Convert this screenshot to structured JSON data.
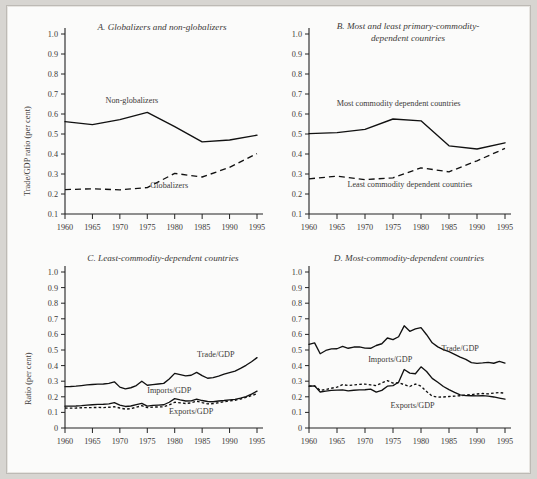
{
  "figure": {
    "background_color": "#fbfbfa",
    "page_color": "#d7d5d1",
    "line_color": "#111111",
    "text_color": "#3b3a38"
  },
  "chart_data": [
    {
      "id": "A",
      "type": "line",
      "title": "A.  Globalizers and non-globalizers",
      "xlabel": "",
      "ylabel": "Trade/GDP ratio (per cent)",
      "xlim": [
        1960,
        1995
      ],
      "ylim": [
        0.1,
        1.0
      ],
      "xticks": [
        1960,
        1965,
        1970,
        1975,
        1980,
        1985,
        1990,
        1995
      ],
      "yticks": [
        "0.1",
        "0.2",
        "0.3",
        "0.4",
        "0.5",
        "0.6",
        "0.7",
        "0.8",
        "0.9",
        "1.0"
      ],
      "grid": false,
      "legend": "inline-annotations",
      "x": [
        1960,
        1965,
        1970,
        1975,
        1980,
        1985,
        1990,
        1995
      ],
      "series": [
        {
          "name": "Non-globalizers",
          "style": "solid",
          "label_x": 1972.2,
          "label_y": 0.655,
          "values": [
            0.562,
            0.547,
            0.572,
            0.608,
            0.537,
            0.461,
            0.47,
            0.494
          ]
        },
        {
          "name": "Globalizers",
          "style": "dashed",
          "label_x": 1979.0,
          "label_y": 0.232,
          "values": [
            0.222,
            0.226,
            0.221,
            0.232,
            0.303,
            0.285,
            0.333,
            0.402
          ]
        }
      ]
    },
    {
      "id": "B",
      "type": "line",
      "title": "B. Most and least primary-commodity-dependent countries",
      "title_lines": [
        "B. Most and least primary-commodity-",
        "dependent countries"
      ],
      "xlabel": "",
      "ylabel": "",
      "xlim": [
        1960,
        1995
      ],
      "ylim": [
        0.1,
        1.0
      ],
      "xticks": [
        1960,
        1965,
        1970,
        1975,
        1980,
        1985,
        1990,
        1995
      ],
      "yticks": [
        "0.1",
        "0.2",
        "0.3",
        "0.4",
        "0.5",
        "0.6",
        "0.7",
        "0.8",
        "0.9",
        "1.0"
      ],
      "grid": false,
      "legend": "inline-annotations",
      "x": [
        1960,
        1965,
        1970,
        1975,
        1980,
        1985,
        1990,
        1995
      ],
      "series": [
        {
          "name": "Most commodity dependent countries",
          "style": "solid",
          "label_x": 1976.0,
          "label_y": 0.638,
          "values": [
            0.502,
            0.507,
            0.523,
            0.575,
            0.566,
            0.441,
            0.425,
            0.456
          ]
        },
        {
          "name": "Least commodity dependent countries",
          "style": "dashed",
          "label_x": 1978.0,
          "label_y": 0.233,
          "values": [
            0.276,
            0.289,
            0.272,
            0.281,
            0.331,
            0.311,
            0.366,
            0.428
          ]
        }
      ]
    },
    {
      "id": "C",
      "type": "line",
      "title": "C.  Least-commodity-dependent countries",
      "xlabel": "",
      "ylabel": "Ratio (per cent)",
      "xlim": [
        1960,
        1995
      ],
      "ylim": [
        0,
        1.0
      ],
      "xticks": [
        1960,
        1965,
        1970,
        1975,
        1980,
        1985,
        1990,
        1995
      ],
      "yticks": [
        "0",
        "0.1",
        "0.2",
        "0.3",
        "0.4",
        "0.5",
        "0.6",
        "0.7",
        "0.8",
        "0.9",
        "1.0"
      ],
      "grid": false,
      "legend": "inline-annotations",
      "x": [
        1960,
        1961,
        1962,
        1963,
        1964,
        1965,
        1966,
        1967,
        1968,
        1969,
        1970,
        1971,
        1972,
        1973,
        1974,
        1975,
        1976,
        1977,
        1978,
        1979,
        1980,
        1981,
        1982,
        1983,
        1984,
        1985,
        1986,
        1987,
        1988,
        1989,
        1990,
        1991,
        1992,
        1993,
        1994,
        1995
      ],
      "series": [
        {
          "name": "Trade/GDP",
          "style": "solid",
          "label_x": 1987.5,
          "label_y": 0.452,
          "values": [
            0.265,
            0.266,
            0.268,
            0.272,
            0.276,
            0.279,
            0.281,
            0.282,
            0.286,
            0.296,
            0.262,
            0.251,
            0.258,
            0.272,
            0.3,
            0.274,
            0.278,
            0.282,
            0.286,
            0.314,
            0.35,
            0.342,
            0.334,
            0.338,
            0.357,
            0.336,
            0.319,
            0.323,
            0.333,
            0.345,
            0.355,
            0.365,
            0.382,
            0.402,
            0.425,
            0.451
          ]
        },
        {
          "name": "Imports/GDP",
          "style": "solid",
          "label_x": 1979.0,
          "label_y": 0.222,
          "values": [
            0.14,
            0.14,
            0.141,
            0.143,
            0.147,
            0.149,
            0.151,
            0.152,
            0.155,
            0.163,
            0.147,
            0.138,
            0.141,
            0.15,
            0.158,
            0.14,
            0.145,
            0.147,
            0.149,
            0.165,
            0.188,
            0.18,
            0.173,
            0.174,
            0.185,
            0.176,
            0.17,
            0.168,
            0.173,
            0.176,
            0.18,
            0.183,
            0.191,
            0.201,
            0.217,
            0.236
          ]
        },
        {
          "name": "Exports/GDP",
          "style": "dotted",
          "label_x": 1983.0,
          "label_y": 0.092,
          "values": [
            0.128,
            0.127,
            0.128,
            0.13,
            0.131,
            0.131,
            0.132,
            0.131,
            0.133,
            0.136,
            0.128,
            0.121,
            0.124,
            0.133,
            0.143,
            0.131,
            0.134,
            0.135,
            0.136,
            0.148,
            0.165,
            0.161,
            0.157,
            0.161,
            0.172,
            0.163,
            0.155,
            0.156,
            0.162,
            0.168,
            0.174,
            0.178,
            0.186,
            0.196,
            0.208,
            0.219
          ]
        }
      ]
    },
    {
      "id": "D",
      "type": "line",
      "title": "D.  Most-commodity-dependent countries",
      "xlabel": "",
      "ylabel": "",
      "xlim": [
        1960,
        1995
      ],
      "ylim": [
        0,
        1.0
      ],
      "xticks": [
        1960,
        1965,
        1970,
        1975,
        1980,
        1985,
        1990,
        1995
      ],
      "yticks": [
        "0",
        "0.1",
        "0.2",
        "0.3",
        "0.4",
        "0.5",
        "0.6",
        "0.7",
        "0.8",
        "0.9",
        "1.0"
      ],
      "grid": false,
      "legend": "inline-annotations",
      "x": [
        1960,
        1961,
        1962,
        1963,
        1964,
        1965,
        1966,
        1967,
        1968,
        1969,
        1970,
        1971,
        1972,
        1973,
        1974,
        1975,
        1976,
        1977,
        1978,
        1979,
        1980,
        1981,
        1982,
        1983,
        1984,
        1985,
        1986,
        1987,
        1988,
        1989,
        1990,
        1991,
        1992,
        1993,
        1994,
        1995
      ],
      "series": [
        {
          "name": "Trade/GDP",
          "style": "solid",
          "label_x": 1987.0,
          "label_y": 0.492,
          "values": [
            0.536,
            0.546,
            0.476,
            0.497,
            0.507,
            0.508,
            0.523,
            0.511,
            0.519,
            0.52,
            0.512,
            0.511,
            0.529,
            0.54,
            0.577,
            0.566,
            0.585,
            0.655,
            0.62,
            0.635,
            0.643,
            0.598,
            0.546,
            0.52,
            0.503,
            0.489,
            0.472,
            0.455,
            0.44,
            0.419,
            0.414,
            0.417,
            0.421,
            0.415,
            0.427,
            0.416
          ]
        },
        {
          "name": "Imports/GDP",
          "style": "solid",
          "label_x": 1974.5,
          "label_y": 0.425,
          "values": [
            0.268,
            0.27,
            0.231,
            0.236,
            0.241,
            0.243,
            0.244,
            0.238,
            0.242,
            0.244,
            0.245,
            0.249,
            0.23,
            0.241,
            0.268,
            0.272,
            0.293,
            0.375,
            0.352,
            0.348,
            0.392,
            0.362,
            0.318,
            0.293,
            0.266,
            0.246,
            0.228,
            0.212,
            0.208,
            0.207,
            0.206,
            0.208,
            0.204,
            0.199,
            0.192,
            0.185
          ]
        },
        {
          "name": "Exports/GDP",
          "style": "dotted",
          "label_x": 1978.5,
          "label_y": 0.128,
          "values": [
            0.268,
            0.27,
            0.241,
            0.247,
            0.255,
            0.262,
            0.278,
            0.272,
            0.276,
            0.28,
            0.281,
            0.276,
            0.272,
            0.289,
            0.304,
            0.288,
            0.29,
            0.278,
            0.266,
            0.282,
            0.268,
            0.234,
            0.204,
            0.198,
            0.199,
            0.202,
            0.204,
            0.207,
            0.211,
            0.214,
            0.218,
            0.221,
            0.219,
            0.224,
            0.227,
            0.223
          ]
        }
      ]
    }
  ]
}
